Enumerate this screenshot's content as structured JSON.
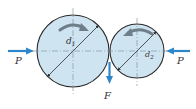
{
  "diagram": {
    "type": "friction-wheel-drive",
    "wheels": [
      {
        "id": "wheel-1",
        "diameter_label": "d",
        "diameter_sub": "1",
        "rotation": "clockwise",
        "cx": 73,
        "cy": 51,
        "r": 36
      },
      {
        "id": "wheel-2",
        "diameter_label": "d",
        "diameter_sub": "2",
        "rotation": "counterclockwise",
        "cx": 137,
        "cy": 51,
        "r": 27
      }
    ],
    "forces": {
      "left": {
        "label": "P",
        "direction": "right"
      },
      "right": {
        "label": "P",
        "direction": "left"
      },
      "contact": {
        "label": "F",
        "direction": "down"
      }
    },
    "colors": {
      "wheel_fill": "#cfe4f1",
      "outline": "#2a2a2a",
      "arrow": "#2f86c8",
      "rotation_arrow": "#6f7f8a",
      "centerline": "#7a8a96",
      "label": "#333333"
    }
  }
}
